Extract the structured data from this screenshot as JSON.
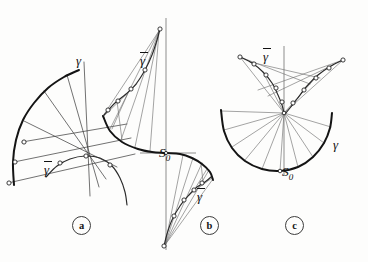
{
  "figure": {
    "caption_tags": [
      {
        "id": "panel-a",
        "label": "a",
        "x": 72,
        "y": 216
      },
      {
        "id": "panel-b",
        "label": "b",
        "x": 200,
        "y": 216
      },
      {
        "id": "panel-c",
        "label": "c",
        "x": 285,
        "y": 216
      }
    ],
    "labels": [
      {
        "id": "gamma-a",
        "text": "γ",
        "bar": false,
        "x": 76,
        "y": 54,
        "panel": "a"
      },
      {
        "id": "gammabar-a",
        "text": "γ",
        "bar": true,
        "x": 44,
        "y": 161,
        "panel": "a"
      },
      {
        "id": "gammabar-b-top",
        "text": "γ",
        "bar": true,
        "x": 140,
        "y": 52,
        "panel": "b"
      },
      {
        "id": "gammabar-b-bottom",
        "text": "γ",
        "bar": true,
        "x": 197,
        "y": 188,
        "panel": "b"
      },
      {
        "id": "s0-b",
        "text": "S",
        "sub": "0",
        "bar": false,
        "x": 159,
        "y": 146,
        "panel": "b"
      },
      {
        "id": "gammabar-c",
        "text": "γ",
        "bar": true,
        "x": 263,
        "y": 48,
        "panel": "c"
      },
      {
        "id": "gamma-c",
        "text": "γ",
        "bar": false,
        "x": 333,
        "y": 138,
        "panel": "c"
      },
      {
        "id": "s0-c",
        "text": "S",
        "sub": "0",
        "bar": false,
        "x": 282,
        "y": 165,
        "panel": "c"
      }
    ],
    "background_color": "#fdfdfc",
    "ink_color": "#141414",
    "ray_color": "#6b6b6b"
  },
  "chart_data": {
    "type": "line",
    "title": "",
    "subtitle": "",
    "xlabel": "",
    "ylabel": "",
    "panels": [
      {
        "name": "a",
        "tag": "a",
        "description": "Quarter arc gamma with tangent lines and involute gammabar",
        "curves": [
          {
            "name": "γ",
            "role": "base-arc",
            "points": [
              [
                14,
                185
              ],
              [
                13,
                162
              ],
              [
                16,
                140
              ],
              [
                23,
                120
              ],
              [
                34,
                103
              ],
              [
                48,
                88
              ],
              [
                64,
                77
              ],
              [
                79,
                70
              ]
            ]
          },
          {
            "name": "γ̄",
            "role": "involute",
            "points": [
              [
                46,
                177
              ],
              [
                57,
                166
              ],
              [
                70,
                159
              ],
              [
                85,
                156
              ],
              [
                100,
                158
              ],
              [
                112,
                166
              ],
              [
                120,
                178
              ],
              [
                125,
                192
              ],
              [
                127,
                205
              ]
            ]
          }
        ],
        "tangent_rays": [
          [
            [
              22,
              142
            ],
            [
              127,
              124
            ]
          ],
          [
            [
              14,
              162
            ],
            [
              131,
              138
            ]
          ],
          [
            [
              8,
              183
            ],
            [
              135,
              154
            ]
          ],
          [
            [
              24,
              121
            ],
            [
              117,
              167
            ]
          ],
          [
            [
              44,
              91
            ],
            [
              106,
              179
            ]
          ],
          [
            [
              67,
              75
            ],
            [
              99,
              187
            ]
          ],
          [
            [
              84,
              62
            ],
            [
              90,
              196
            ]
          ]
        ],
        "nodes": [
          [
            24,
            142
          ],
          [
            15,
            162
          ],
          [
            9,
            183
          ],
          [
            60,
            163
          ],
          [
            86,
            156
          ],
          [
            110,
            165
          ]
        ]
      },
      {
        "name": "b",
        "tag": "b",
        "description": "S-shaped base curve through S0 with two involute branches gammabar and radiating tangent fans",
        "axis": {
          "x": 166,
          "y_top": 18,
          "y_bottom": 250
        },
        "origin": [
          166,
          153
        ],
        "curves": [
          {
            "name": "base-S-curve",
            "role": "base",
            "points": [
              [
                103,
                116
              ],
              [
                110,
                131
              ],
              [
                122,
                142
              ],
              [
                138,
                149
              ],
              [
                152,
                152
              ],
              [
                166,
                153
              ],
              [
                180,
                154
              ],
              [
                192,
                158
              ],
              [
                202,
                164
              ],
              [
                210,
                172
              ],
              [
                213,
                180
              ]
            ]
          },
          {
            "name": "γ̄",
            "role": "involute-upper",
            "points": [
              [
                104,
                115
              ],
              [
                115,
                103
              ],
              [
                126,
                94
              ],
              [
                136,
                84
              ],
              [
                145,
                70
              ],
              [
                152,
                55
              ],
              [
                157,
                40
              ],
              [
                160,
                29
              ]
            ]
          },
          {
            "name": "γ̄",
            "role": "involute-lower",
            "points": [
              [
                211,
                177
              ],
              [
                205,
                182
              ],
              [
                197,
                187
              ],
              [
                189,
                195
              ],
              [
                180,
                206
              ],
              [
                172,
                220
              ],
              [
                167,
                234
              ],
              [
                164,
                246
              ]
            ]
          }
        ],
        "fan_upper": [
          [
            [
              103,
              116
            ],
            [
              159,
              31
            ]
          ],
          [
            [
              110,
              129
            ],
            [
              159,
              31
            ]
          ],
          [
            [
              121,
              140
            ],
            [
              159,
              31
            ]
          ],
          [
            [
              135,
              147
            ],
            [
              159,
              31
            ]
          ],
          [
            [
              150,
              151
            ],
            [
              159,
              31
            ]
          ],
          [
            [
              104,
              116
            ],
            [
              137,
              84
            ]
          ],
          [
            [
              112,
              129
            ],
            [
              128,
              93
            ]
          ],
          [
            [
              122,
              140
            ],
            [
              117,
              101
            ]
          ]
        ],
        "fan_lower": [
          [
            [
              213,
              179
            ],
            [
              165,
              245
            ]
          ],
          [
            [
              209,
              170
            ],
            [
              165,
              245
            ]
          ],
          [
            [
              202,
              163
            ],
            [
              165,
              245
            ]
          ],
          [
            [
              193,
              158
            ],
            [
              165,
              245
            ]
          ],
          [
            [
              183,
              155
            ],
            [
              165,
              245
            ]
          ],
          [
            [
              212,
              178
            ],
            [
              190,
              194
            ]
          ],
          [
            [
              207,
              169
            ],
            [
              196,
              187
            ]
          ],
          [
            [
              201,
              163
            ],
            [
              203,
              182
            ]
          ]
        ],
        "nodes_upper": [
          [
            160,
            29
          ],
          [
            145,
            70
          ],
          [
            131,
            89
          ],
          [
            118,
            101
          ],
          [
            108,
            110
          ]
        ],
        "nodes_lower": [
          [
            164,
            246
          ],
          [
            174,
            216
          ],
          [
            184,
            200
          ],
          [
            194,
            190
          ],
          [
            202,
            183
          ]
        ]
      },
      {
        "name": "c",
        "tag": "c",
        "description": "Large concave arc gamma with cusped involute gammabar and fan of normals meeting near the cusp",
        "curves": [
          {
            "name": "γ",
            "role": "base-arc",
            "points": [
              [
                221,
                110
              ],
              [
                224,
                131
              ],
              [
                232,
                148
              ],
              [
                245,
                161
              ],
              [
                262,
                169
              ],
              [
                280,
                171
              ],
              [
                298,
                167
              ],
              [
                313,
                157
              ],
              [
                324,
                143
              ],
              [
                330,
                128
              ],
              [
                332,
                113
              ]
            ]
          },
          {
            "name": "γ̄-left",
            "role": "involute-left",
            "points": [
              [
                240,
                57
              ],
              [
                252,
                63
              ],
              [
                263,
                72
              ],
              [
                272,
                83
              ],
              [
                278,
                95
              ],
              [
                282,
                105
              ],
              [
                284,
                113
              ]
            ]
          },
          {
            "name": "γ̄-right",
            "role": "involute-right",
            "points": [
              [
                343,
                60
              ],
              [
                331,
                66
              ],
              [
                318,
                75
              ],
              [
                307,
                86
              ],
              [
                297,
                99
              ],
              [
                290,
                108
              ],
              [
                285,
                114
              ]
            ]
          }
        ],
        "fan_rays": [
          [
            [
              221,
              111
            ],
            [
              284,
              113
            ]
          ],
          [
            [
              224,
              130
            ],
            [
              284,
              113
            ]
          ],
          [
            [
              232,
              147
            ],
            [
              284,
              113
            ]
          ],
          [
            [
              245,
              160
            ],
            [
              284,
              113
            ]
          ],
          [
            [
              262,
              169
            ],
            [
              284,
              113
            ]
          ],
          [
            [
              280,
              171
            ],
            [
              284,
              113
            ]
          ],
          [
            [
              298,
              167
            ],
            [
              284,
              113
            ]
          ],
          [
            [
              313,
              157
            ],
            [
              284,
              113
            ]
          ],
          [
            [
              324,
              143
            ],
            [
              284,
              113
            ]
          ],
          [
            [
              331,
              127
            ],
            [
              284,
              113
            ]
          ],
          [
            [
              240,
              57
            ],
            [
              284,
              113
            ]
          ],
          [
            [
              263,
              72
            ],
            [
              284,
              113
            ]
          ],
          [
            [
              343,
              60
            ],
            [
              284,
              113
            ]
          ],
          [
            [
              318,
              75
            ],
            [
              284,
              113
            ]
          ]
        ],
        "chord_rays": [
          [
            [
              240,
              57
            ],
            [
              310,
              84
            ]
          ],
          [
            [
              250,
              62
            ],
            [
              320,
              78
            ]
          ],
          [
            [
              343,
              60
            ],
            [
              258,
              90
            ]
          ],
          [
            [
              333,
              65
            ],
            [
              268,
              96
            ]
          ]
        ],
        "axis": {
          "x": 284,
          "y_top": 46,
          "y_bottom": 175
        },
        "nodes_left": [
          [
            240,
            57
          ],
          [
            254,
            64
          ],
          [
            266,
            75
          ],
          [
            276,
            88
          ],
          [
            282,
            102
          ]
        ],
        "nodes_right": [
          [
            343,
            60
          ],
          [
            329,
            68
          ],
          [
            316,
            78
          ],
          [
            304,
            90
          ],
          [
            293,
            103
          ]
        ],
        "node_cusp": [
          284,
          113
        ],
        "node_s0": [
          280,
          171
        ]
      }
    ]
  }
}
